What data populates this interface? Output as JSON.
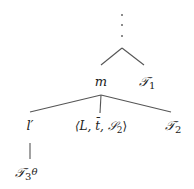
{
  "diagram": {
    "type": "tree",
    "continuation": "⋮",
    "nodes": {
      "m": "m",
      "t1": "𝒯",
      "t1_sub": "1",
      "l_prime": "l′",
      "tuple": "⟨L, t̄, 𝒮",
      "tuple_sub": "2",
      "tuple_close": "⟩",
      "t2": "𝒯",
      "t2_sub": "2",
      "t3": "𝒯",
      "t3_sub": "3",
      "theta": "θ"
    },
    "edges": [
      [
        "top",
        "m"
      ],
      [
        "top",
        "T1"
      ],
      [
        "m",
        "l′"
      ],
      [
        "m",
        "⟨L, t̄, S2⟩"
      ],
      [
        "m",
        "T2"
      ],
      [
        "l′",
        "T3θ"
      ]
    ]
  }
}
